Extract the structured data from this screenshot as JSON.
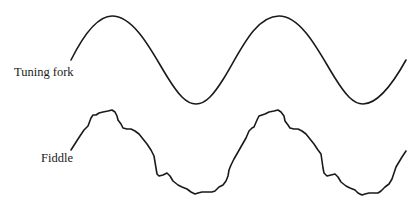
{
  "figure": {
    "labels": {
      "tuning_fork": "Tuning fork",
      "fiddle": "Fiddle"
    },
    "stroke_color": "#1a1a1a",
    "background_color": "#ffffff"
  },
  "waveforms": [
    {
      "name": "Tuning fork",
      "shape": "pure sine wave",
      "cycles": 2
    },
    {
      "name": "Fiddle",
      "shape": "complex periodic wave with harmonic ripples",
      "cycles": 2
    }
  ]
}
